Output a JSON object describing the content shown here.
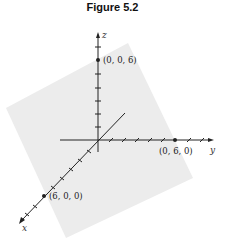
{
  "figure": {
    "title": "Figure 5.2",
    "axes": {
      "x_label": "x",
      "y_label": "y",
      "z_label": "z"
    },
    "points": [
      {
        "label": "(0, 0, 6)",
        "coords": [
          0,
          0,
          6
        ]
      },
      {
        "label": "(0, 6, 0)",
        "coords": [
          0,
          6,
          0
        ]
      },
      {
        "label": "(6, 0, 0)",
        "coords": [
          6,
          0,
          0
        ]
      }
    ],
    "plane_color": "#ececec",
    "axis_color": "#222222"
  }
}
